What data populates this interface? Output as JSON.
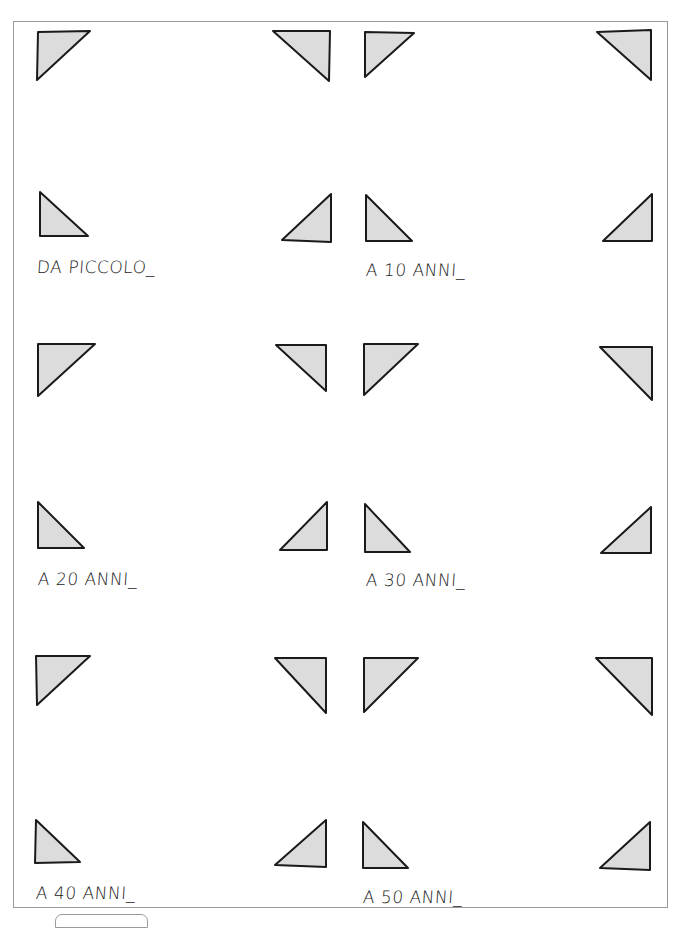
{
  "panels": [
    {
      "caption": "DA PICCOLO_"
    },
    {
      "caption": "A 10 ANNI_"
    },
    {
      "caption": "A 20 ANNI_"
    },
    {
      "caption": "A 30 ANNI_"
    },
    {
      "caption": "A 40 ANNI_"
    },
    {
      "caption": "A 50 ANNI_"
    }
  ],
  "colors": {
    "triangle_fill": "#dcdcdc",
    "triangle_stroke": "#1a1a1a",
    "border": "#9a9a9a"
  }
}
